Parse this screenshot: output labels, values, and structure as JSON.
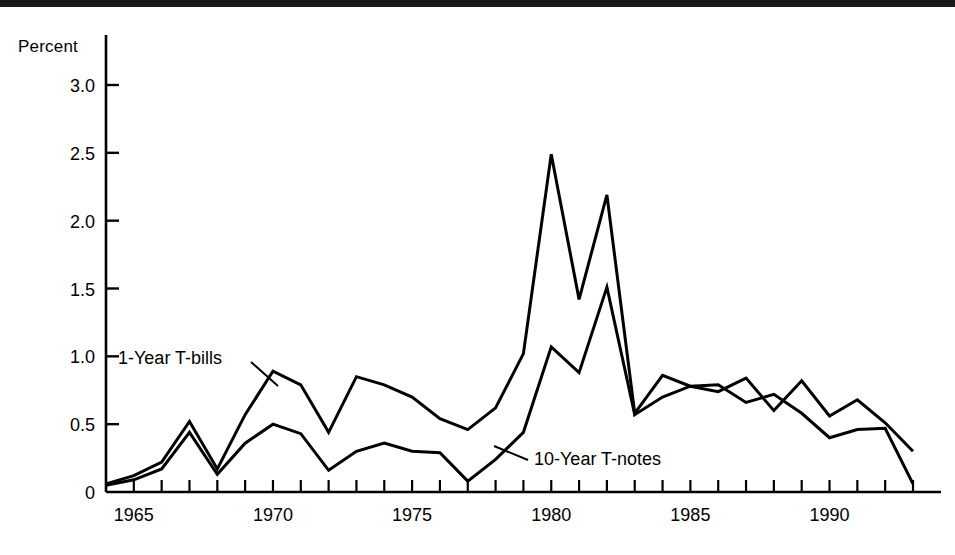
{
  "chart_data": {
    "type": "line",
    "title": "",
    "xlabel": "",
    "ylabel": "Percent",
    "ylim": [
      0,
      3.25
    ],
    "xlim": [
      1964,
      1993
    ],
    "yticks": [
      0,
      0.5,
      1.0,
      1.5,
      2.0,
      2.5,
      3.0
    ],
    "ytick_labels": [
      "0",
      "0.5",
      "1.0",
      "1.5",
      "2.0",
      "2.5",
      "3.0"
    ],
    "xticks": [
      1965,
      1970,
      1975,
      1980,
      1985,
      1990
    ],
    "xtick_labels": [
      "1965",
      "1970",
      "1975",
      "1980",
      "1985",
      "1990"
    ],
    "minor_xticks_every": 1,
    "grid": false,
    "legend": "inline-annotations",
    "x": [
      1964,
      1965,
      1966,
      1967,
      1968,
      1969,
      1970,
      1971,
      1972,
      1973,
      1974,
      1975,
      1976,
      1977,
      1978,
      1979,
      1980,
      1981,
      1982,
      1983,
      1984,
      1985,
      1986,
      1987,
      1988,
      1989,
      1990,
      1991,
      1992,
      1993
    ],
    "series": [
      {
        "name": "1-Year T-bills",
        "color": "#000000",
        "label_position": "upper-left",
        "values": [
          0.06,
          0.12,
          0.22,
          0.52,
          0.17,
          0.57,
          0.89,
          0.79,
          0.44,
          0.85,
          0.79,
          0.7,
          0.54,
          0.46,
          0.62,
          1.02,
          2.49,
          1.42,
          2.19,
          0.58,
          0.86,
          0.78,
          0.74,
          0.84,
          0.6,
          0.82,
          0.56,
          0.68,
          0.51,
          0.3
        ]
      },
      {
        "name": "10-Year T-notes",
        "color": "#000000",
        "label_position": "lower-middle",
        "values": [
          0.05,
          0.09,
          0.17,
          0.44,
          0.13,
          0.36,
          0.5,
          0.43,
          0.16,
          0.3,
          0.36,
          0.3,
          0.29,
          0.08,
          0.24,
          0.44,
          1.07,
          0.88,
          1.51,
          0.57,
          0.7,
          0.78,
          0.79,
          0.66,
          0.72,
          0.58,
          0.4,
          0.46,
          0.47,
          0.06
        ]
      }
    ],
    "annotations": [
      {
        "text": "1-Year T-bills",
        "x_text": 118,
        "y_text": 364,
        "leader_from": [
          251,
          362
        ],
        "leader_to": [
          278,
          386
        ]
      },
      {
        "text": "10-Year T-notes",
        "x_text": 534,
        "y_text": 465,
        "leader_from": [
          528,
          460
        ],
        "leader_to": [
          494,
          446
        ]
      }
    ]
  },
  "axis": {
    "ylabel_text": "Percent"
  }
}
